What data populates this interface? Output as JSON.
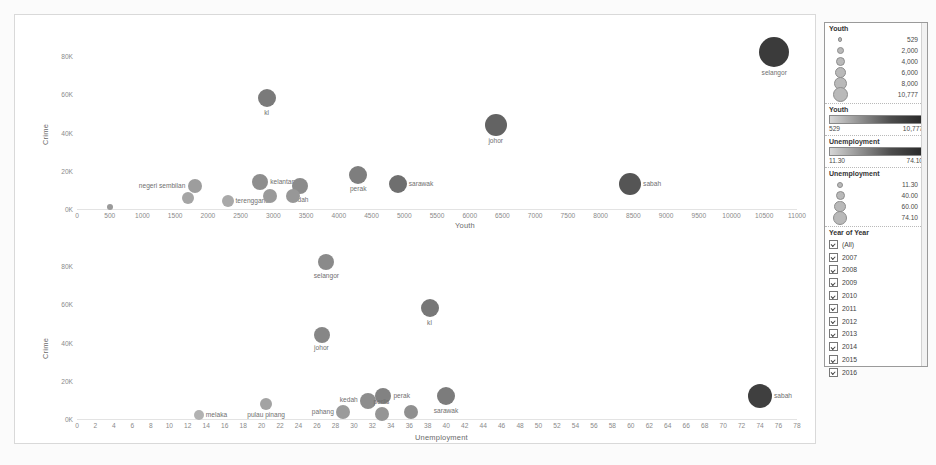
{
  "charts": [
    {
      "id": "youth-vs-crime",
      "chart_data": {
        "type": "scatter",
        "title": "",
        "xlabel": "Youth",
        "ylabel": "Crime",
        "xlim": [
          0,
          11000
        ],
        "xticks": [
          0,
          500,
          1000,
          1500,
          2000,
          2500,
          3000,
          3500,
          4000,
          4500,
          5000,
          5500,
          6000,
          6500,
          7000,
          7500,
          8000,
          8500,
          9000,
          9500,
          10000,
          10500,
          11000
        ],
        "ylim": [
          0,
          90000
        ],
        "yticks": [
          0,
          20000,
          40000,
          60000,
          80000
        ],
        "yticklabels": [
          "0K",
          "20K",
          "40K",
          "60K",
          "80K"
        ],
        "grid": false,
        "points": [
          {
            "label": "",
            "x": 500,
            "y": 1000,
            "size": 3,
            "shade": "#9a9a9a"
          },
          {
            "label": "negeri sembilan",
            "x": 1800,
            "y": 12000,
            "size": 7,
            "shade": "#9d9d9d",
            "label_pos": "left"
          },
          {
            "label": "",
            "x": 1700,
            "y": 5500,
            "size": 6,
            "shade": "#a5a5a5"
          },
          {
            "label": "terengganu",
            "x": 2300,
            "y": 4000,
            "size": 6,
            "shade": "#a9a9a9",
            "label_pos": "right"
          },
          {
            "label": "kelantan",
            "x": 2800,
            "y": 14000,
            "size": 8,
            "shade": "#8e8e8e",
            "label_pos": "right"
          },
          {
            "label": "",
            "x": 2950,
            "y": 7000,
            "size": 7,
            "shade": "#9a9a9a"
          },
          {
            "label": "kedah",
            "x": 3400,
            "y": 12000,
            "size": 8,
            "shade": "#8b8b8b",
            "label_pos": "below"
          },
          {
            "label": "",
            "x": 3300,
            "y": 7000,
            "size": 7,
            "shade": "#979797"
          },
          {
            "label": "perak",
            "x": 4300,
            "y": 18000,
            "size": 9,
            "shade": "#7e7e7e",
            "label_pos": "below"
          },
          {
            "label": "sarawak",
            "x": 4900,
            "y": 13000,
            "size": 9,
            "shade": "#6f6f6f",
            "label_pos": "right"
          },
          {
            "label": "kl",
            "x": 2900,
            "y": 58000,
            "size": 9,
            "shade": "#7a7a7a",
            "label_pos": "below"
          },
          {
            "label": "johor",
            "x": 6400,
            "y": 44000,
            "size": 11,
            "shade": "#636363",
            "label_pos": "below"
          },
          {
            "label": "sabah",
            "x": 8450,
            "y": 13000,
            "size": 11,
            "shade": "#555555",
            "label_pos": "right"
          },
          {
            "label": "selangor",
            "x": 10650,
            "y": 82000,
            "size": 15,
            "shade": "#3b3b3b",
            "label_pos": "below"
          }
        ]
      }
    },
    {
      "id": "unemployment-vs-crime",
      "chart_data": {
        "type": "scatter",
        "title": "",
        "xlabel": "Unemployment",
        "ylabel": "Crime",
        "xlim": [
          0,
          78
        ],
        "xticks": [
          0,
          2,
          4,
          6,
          8,
          10,
          12,
          14,
          16,
          18,
          20,
          22,
          24,
          26,
          28,
          30,
          32,
          34,
          36,
          38,
          40,
          42,
          44,
          46,
          48,
          50,
          52,
          54,
          56,
          58,
          60,
          62,
          64,
          66,
          68,
          70,
          72,
          74,
          76,
          78
        ],
        "ylim": [
          0,
          90000
        ],
        "yticks": [
          0,
          20000,
          40000,
          60000,
          80000
        ],
        "yticklabels": [
          "0K",
          "20K",
          "40K",
          "60K",
          "80K"
        ],
        "grid": false,
        "points": [
          {
            "label": "melaka",
            "x": 13.2,
            "y": 2000,
            "size": 5,
            "shade": "#b2b2b2",
            "label_pos": "right"
          },
          {
            "label": "pulau pinang",
            "x": 20.5,
            "y": 8000,
            "size": 6,
            "shade": "#a3a3a3",
            "label_pos": "below"
          },
          {
            "label": "pahang",
            "x": 28.8,
            "y": 3500,
            "size": 7,
            "shade": "#9b9b9b",
            "label_pos": "left"
          },
          {
            "label": "kedah",
            "x": 31.5,
            "y": 9500,
            "size": 8,
            "shade": "#8d8d8d",
            "label_pos": "left"
          },
          {
            "label": "perak",
            "x": 33.2,
            "y": 12000,
            "size": 8,
            "shade": "#828282",
            "label_pos": "right"
          },
          {
            "label": "perlis",
            "x": 33.0,
            "y": 2500,
            "size": 7,
            "shade": "#959595",
            "label_pos": "above"
          },
          {
            "label": "",
            "x": 36.2,
            "y": 3500,
            "size": 7,
            "shade": "#909090"
          },
          {
            "label": "sarawak",
            "x": 40.0,
            "y": 12000,
            "size": 9,
            "shade": "#7c7c7c",
            "label_pos": "below"
          },
          {
            "label": "johor",
            "x": 26.5,
            "y": 44000,
            "size": 8,
            "shade": "#868686",
            "label_pos": "below"
          },
          {
            "label": "kl",
            "x": 38.2,
            "y": 58000,
            "size": 9,
            "shade": "#777777",
            "label_pos": "below"
          },
          {
            "label": "selangor",
            "x": 27.0,
            "y": 82000,
            "size": 8,
            "shade": "#8a8a8a",
            "label_pos": "below"
          },
          {
            "label": "sabah",
            "x": 74.0,
            "y": 12000,
            "size": 12,
            "shade": "#3f3f3f",
            "label_pos": "right"
          }
        ]
      }
    }
  ],
  "legend": {
    "size_legend": {
      "title": "Youth",
      "items": [
        {
          "value": "529",
          "dot": 2.5
        },
        {
          "value": "2,000",
          "dot": 5
        },
        {
          "value": "4,000",
          "dot": 7
        },
        {
          "value": "6,000",
          "dot": 9
        },
        {
          "value": "8,000",
          "dot": 11
        },
        {
          "value": "10,777",
          "dot": 13
        }
      ]
    },
    "youth_gradient": {
      "title": "Youth",
      "min": "529",
      "max": "10,777"
    },
    "unemployment_gradient": {
      "title": "Unemployment",
      "min": "11.30",
      "max": "74.10"
    },
    "unemployment_size": {
      "title": "Unemployment",
      "items": [
        {
          "value": "11.30",
          "dot": 4
        },
        {
          "value": "40.00",
          "dot": 7
        },
        {
          "value": "60.00",
          "dot": 9.5
        },
        {
          "value": "74.10",
          "dot": 12
        }
      ]
    },
    "year_filter": {
      "title": "Year of Year",
      "items": [
        {
          "label": "(All)",
          "checked": true
        },
        {
          "label": "2007",
          "checked": true
        },
        {
          "label": "2008",
          "checked": true
        },
        {
          "label": "2009",
          "checked": true
        },
        {
          "label": "2010",
          "checked": true
        },
        {
          "label": "2011",
          "checked": true
        },
        {
          "label": "2012",
          "checked": true
        },
        {
          "label": "2013",
          "checked": true
        },
        {
          "label": "2014",
          "checked": true
        },
        {
          "label": "2015",
          "checked": true
        },
        {
          "label": "2016",
          "checked": true
        }
      ]
    }
  }
}
